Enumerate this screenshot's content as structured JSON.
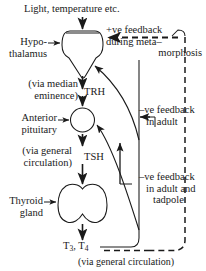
{
  "diagram": {
    "stroke_color": "#1a1a1a",
    "background_color": "#ffffff",
    "labels": {
      "stimulus": "Light, temperature etc.",
      "hypothalamus_line1": "Hypo-",
      "hypothalamus_line2": "thalamus",
      "via_median_line1": "(via median",
      "via_median_line2": "eminence)",
      "trh": "TRH",
      "anterior_pituitary_line1": "Anterior",
      "anterior_pituitary_line2": "pituitary",
      "via_general_line1": "(via general",
      "via_general_line2": "circulation)",
      "tsh": "TSH",
      "thyroid_line1": "Thyroid",
      "thyroid_line2": "gland",
      "hormones_base": "T",
      "hormones_sub1": "3",
      "hormones_mid": ", T",
      "hormones_sub2": "4",
      "via_general_circulation": "(via general circulation)",
      "pos_feedback_line1": "+ve feedback",
      "pos_feedback_line2": "during meta–",
      "pos_feedback_line3": "morphosis",
      "neg_feedback_adult_line1": "–ve feedback",
      "neg_feedback_adult_line2": "in adult",
      "neg_feedback_tadpole_line1": "–ve feedback",
      "neg_feedback_tadpole_line2": "in adult and",
      "neg_feedback_tadpole_line3": "tadpole"
    },
    "nodes": [
      {
        "name": "hypothalamus",
        "shape": "butterfly-outline"
      },
      {
        "name": "anterior-pituitary",
        "shape": "circle"
      },
      {
        "name": "thyroid-gland",
        "shape": "bilobed-outline"
      }
    ],
    "connectors": [
      {
        "name": "stimulus-to-hypothalamus",
        "style": "solid",
        "direction": "down"
      },
      {
        "name": "hypothalamus-to-pituitary-trh",
        "style": "solid",
        "direction": "down"
      },
      {
        "name": "pituitary-to-thyroid-tsh",
        "style": "solid",
        "direction": "down"
      },
      {
        "name": "thyroid-to-hormones",
        "style": "solid",
        "direction": "down"
      },
      {
        "name": "positive-feedback-to-hypothalamus",
        "style": "dashed",
        "direction": "left"
      },
      {
        "name": "negative-feedback-to-hypothalamus",
        "style": "solid",
        "direction": "curve-left"
      },
      {
        "name": "negative-feedback-to-pituitary",
        "style": "solid",
        "direction": "curve-left"
      }
    ]
  }
}
